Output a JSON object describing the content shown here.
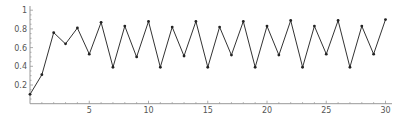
{
  "chart_data": {
    "type": "line",
    "title": "",
    "xlabel": "",
    "ylabel": "",
    "x": [
      0,
      1,
      2,
      3,
      4,
      5,
      6,
      7,
      8,
      9,
      10,
      11,
      12,
      13,
      14,
      15,
      16,
      17,
      18,
      19,
      20,
      21,
      22,
      23,
      24,
      25,
      26,
      27,
      28,
      29,
      30
    ],
    "series": [
      {
        "name": "series",
        "values": [
          0.1,
          0.31,
          0.76,
          0.64,
          0.81,
          0.53,
          0.87,
          0.39,
          0.83,
          0.5,
          0.88,
          0.39,
          0.82,
          0.51,
          0.88,
          0.39,
          0.82,
          0.52,
          0.88,
          0.39,
          0.83,
          0.52,
          0.89,
          0.39,
          0.83,
          0.53,
          0.89,
          0.39,
          0.83,
          0.53,
          0.9
        ],
        "color": "#333333",
        "markers": true
      }
    ],
    "xticks": [
      5,
      10,
      15,
      20,
      25,
      30
    ],
    "xtick_labels": [
      "5",
      "10",
      "15",
      "20",
      "25",
      "30"
    ],
    "yticks": [
      0.2,
      0.4,
      0.6,
      0.8,
      1
    ],
    "ytick_labels": [
      "0.2",
      "0.4",
      "0.6",
      "0.8",
      "1"
    ],
    "xlim": [
      0,
      30.6
    ],
    "ylim": [
      0,
      1.0
    ],
    "grid": false,
    "legend": null
  }
}
